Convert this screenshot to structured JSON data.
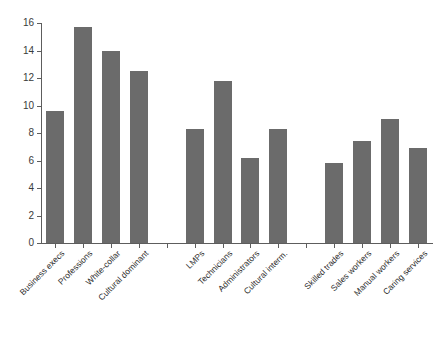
{
  "chart_data": {
    "type": "bar",
    "title": "",
    "subtitle": "",
    "xlabel": "",
    "ylabel": "",
    "ylim": [
      0,
      16
    ],
    "yticks": [
      0,
      2,
      4,
      6,
      8,
      10,
      12,
      14,
      16
    ],
    "grid": false,
    "legend": null,
    "bar_color": "#6b6b6b",
    "axis_color": "#5d5d5d",
    "background": "#ffffff",
    "groups": [
      {
        "name": "Dominant",
        "categories": [
          "Business execs",
          "Professions",
          "White-collar",
          "Cultural dominant"
        ],
        "values": [
          9.6,
          15.7,
          14.0,
          12.5
        ]
      },
      {
        "name": "Intermediate",
        "categories": [
          "LMPs",
          "Technicians",
          "Administrators",
          "Cultural interm."
        ],
        "values": [
          8.3,
          11.8,
          6.2,
          8.3
        ]
      },
      {
        "name": "Working",
        "categories": [
          "Skilled trades",
          "Sales workers",
          "Manual workers",
          "Caring services"
        ],
        "values": [
          5.8,
          7.4,
          9.0,
          6.9
        ]
      }
    ],
    "categories": [
      "Business execs",
      "Professions",
      "White-collar",
      "Cultural dominant",
      "",
      "LMPs",
      "Technicians",
      "Administrators",
      "Cultural interm.",
      "",
      "Skilled trades",
      "Sales workers",
      "Manual workers",
      "Caring services"
    ],
    "values": [
      9.6,
      15.7,
      14.0,
      12.5,
      null,
      8.3,
      11.8,
      6.2,
      8.3,
      null,
      5.8,
      7.4,
      9.0,
      6.9
    ]
  }
}
